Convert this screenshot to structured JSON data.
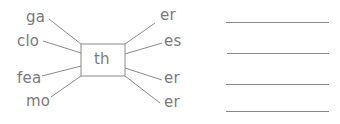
{
  "exercise": {
    "center": "th",
    "left_fragments": [
      "ga",
      "clo",
      "fea",
      "mo"
    ],
    "right_fragments": [
      "er",
      "es",
      "er",
      "er"
    ],
    "answer_lines": 4
  },
  "colors": {
    "text": "#7a7a7a",
    "lines": "#8a8a8a",
    "background": "#ffffff"
  }
}
